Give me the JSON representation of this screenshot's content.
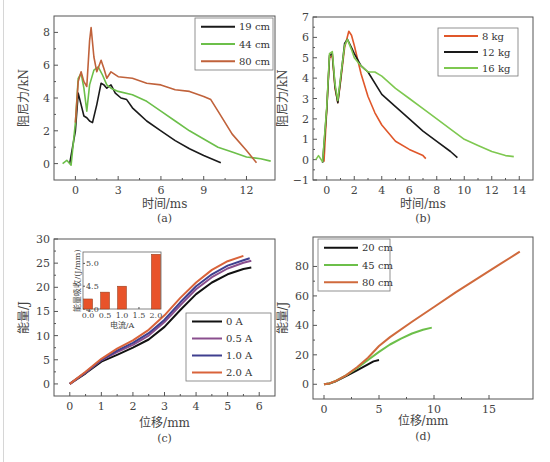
{
  "chart_data": [
    {
      "id": "a",
      "type": "line",
      "caption": "(a)",
      "xlabel": "时间/ms",
      "ylabel": "阻尼力/kN",
      "xlim": [
        -1.5,
        14
      ],
      "ylim": [
        -1,
        9
      ],
      "xticks": [
        0,
        3,
        6,
        9,
        12
      ],
      "yticks": [
        0,
        2,
        4,
        6,
        8
      ],
      "legend_position": "top-right",
      "series": [
        {
          "name": "19 cm",
          "color": "#1a1a1a",
          "x": [
            -0.4,
            0,
            0.2,
            0.4,
            0.6,
            0.8,
            1.0,
            1.2,
            1.5,
            1.8,
            2.0,
            2.2,
            2.5,
            2.8,
            3.2,
            3.6,
            4.0,
            4.5,
            5.0,
            6.0,
            7.0,
            8.0,
            9.0,
            10.2
          ],
          "y": [
            0,
            2.0,
            4.3,
            3.6,
            2.9,
            2.8,
            2.6,
            2.5,
            3.6,
            4.9,
            4.8,
            4.6,
            4.8,
            4.3,
            4.0,
            3.9,
            3.4,
            3.0,
            2.6,
            2.0,
            1.4,
            0.9,
            0.5,
            0.05
          ]
        },
        {
          "name": "44 cm",
          "color": "#6cbf4a",
          "x": [
            -0.9,
            -0.6,
            -0.3,
            0,
            0.2,
            0.4,
            0.6,
            0.8,
            1.0,
            1.3,
            1.6,
            1.9,
            2.2,
            2.5,
            3.0,
            4.0,
            5.0,
            6.0,
            7.0,
            8.0,
            9.0,
            10.0,
            11.0,
            12.0,
            13.0,
            13.7
          ],
          "y": [
            0,
            0.2,
            -0.1,
            2.5,
            5.2,
            5.5,
            4.6,
            3.2,
            4.8,
            5.7,
            5.9,
            5.4,
            4.8,
            4.6,
            4.4,
            4.2,
            3.8,
            3.2,
            2.6,
            2.0,
            1.5,
            1.0,
            0.7,
            0.4,
            0.3,
            0.15
          ]
        },
        {
          "name": "80 cm",
          "color": "#c0623b",
          "x": [
            0,
            0.2,
            0.4,
            0.6,
            0.8,
            1.0,
            1.1,
            1.3,
            1.5,
            1.8,
            2.0,
            2.2,
            2.5,
            3.0,
            4.0,
            5.0,
            6.0,
            7.0,
            8.0,
            9.0,
            9.5,
            10.0,
            11.0,
            12.0,
            12.7
          ],
          "y": [
            2.5,
            5.0,
            5.6,
            5.0,
            4.7,
            7.5,
            8.3,
            6.5,
            5.6,
            6.3,
            5.8,
            5.2,
            5.6,
            5.3,
            5.2,
            4.9,
            4.8,
            4.5,
            4.4,
            4.1,
            3.9,
            3.2,
            1.8,
            0.8,
            0.05
          ]
        }
      ]
    },
    {
      "id": "b",
      "type": "line",
      "caption": "(b)",
      "xlabel": "时间/ms",
      "ylabel": "阻尼力/kN",
      "xlim": [
        -1,
        15
      ],
      "ylim": [
        -1,
        7
      ],
      "xticks": [
        0,
        2,
        4,
        6,
        8,
        10,
        12,
        14
      ],
      "yticks": [
        -1,
        0,
        1,
        2,
        3,
        4,
        5,
        6,
        7
      ],
      "legend_position": "top-right",
      "series": [
        {
          "name": "8 kg",
          "color": "#e0572a",
          "x": [
            -0.2,
            0,
            0.2,
            0.4,
            0.6,
            0.8,
            1.0,
            1.3,
            1.6,
            1.8,
            2.0,
            2.5,
            3.0,
            3.5,
            4.0,
            5.0,
            6.0,
            7.0,
            7.2
          ],
          "y": [
            -0.1,
            2.5,
            5.0,
            5.1,
            3.5,
            2.8,
            3.8,
            5.5,
            6.3,
            6.1,
            5.6,
            4.2,
            3.1,
            2.3,
            1.7,
            0.9,
            0.5,
            0.2,
            0.05
          ]
        },
        {
          "name": "12 kg",
          "color": "#1a1a1a",
          "x": [
            -0.3,
            0,
            0.2,
            0.4,
            0.6,
            0.8,
            1.0,
            1.3,
            1.5,
            1.8,
            2.0,
            2.5,
            3.0,
            4.0,
            5.0,
            6.0,
            7.0,
            8.0,
            9.0,
            9.5
          ],
          "y": [
            -0.15,
            2.5,
            5.1,
            5.2,
            3.6,
            2.8,
            3.9,
            5.7,
            5.9,
            5.5,
            5.2,
            4.6,
            4.3,
            3.2,
            2.6,
            2.0,
            1.4,
            0.9,
            0.4,
            0.1
          ]
        },
        {
          "name": "16 kg",
          "color": "#7ec850",
          "x": [
            -0.8,
            -0.6,
            -0.3,
            0,
            0.2,
            0.4,
            0.6,
            0.8,
            1.0,
            1.3,
            1.5,
            1.8,
            2.0,
            2.5,
            3.0,
            3.5,
            4.0,
            5.0,
            6.0,
            7.0,
            8.0,
            9.0,
            10.0,
            11.0,
            12.0,
            13.0,
            13.6
          ],
          "y": [
            0,
            0.2,
            -0.1,
            2.6,
            5.2,
            5.3,
            3.7,
            2.9,
            4.0,
            5.6,
            5.9,
            5.4,
            5.0,
            4.6,
            4.3,
            4.3,
            4.1,
            3.5,
            3.0,
            2.5,
            2.0,
            1.5,
            1.0,
            0.7,
            0.4,
            0.2,
            0.15
          ]
        }
      ]
    },
    {
      "id": "c",
      "type": "line",
      "caption": "(c)",
      "xlabel": "位移/mm",
      "ylabel": "能量/J",
      "xlim": [
        -0.5,
        6.5
      ],
      "ylim": [
        -2.5,
        30
      ],
      "xticks": [
        0,
        1,
        2,
        3,
        4,
        5,
        6
      ],
      "yticks": [
        0,
        5,
        10,
        15,
        20,
        25,
        30
      ],
      "legend_position": "lower-right",
      "series": [
        {
          "name": "0 A",
          "color": "#111111",
          "x": [
            0,
            0.5,
            1.0,
            1.5,
            2.0,
            2.5,
            3.0,
            3.5,
            4.0,
            4.5,
            5.0,
            5.5,
            5.75
          ],
          "y": [
            0,
            2.2,
            4.6,
            6.0,
            7.5,
            9.2,
            11.8,
            15.3,
            18.6,
            21.0,
            22.7,
            23.8,
            24.1
          ]
        },
        {
          "name": "0.5 A",
          "color": "#8a4f8e",
          "x": [
            0,
            0.5,
            1.0,
            1.5,
            2.0,
            2.5,
            3.0,
            3.5,
            4.0,
            4.5,
            5.0,
            5.5,
            5.75
          ],
          "y": [
            0,
            2.3,
            4.9,
            6.6,
            8.1,
            10.0,
            12.8,
            16.3,
            19.6,
            22.1,
            23.9,
            25.1,
            25.5
          ]
        },
        {
          "name": "1.0 A",
          "color": "#3f3f8f",
          "x": [
            0,
            0.5,
            1.0,
            1.5,
            2.0,
            2.5,
            3.0,
            3.5,
            4.0,
            4.5,
            5.0,
            5.5,
            5.7
          ],
          "y": [
            0,
            2.4,
            5.0,
            6.9,
            8.5,
            10.5,
            13.3,
            16.9,
            20.2,
            22.7,
            24.5,
            25.6,
            26.0
          ]
        },
        {
          "name": "2.0 A",
          "color": "#d9633a",
          "x": [
            0,
            0.5,
            1.0,
            1.5,
            2.0,
            2.5,
            3.0,
            3.5,
            4.0,
            4.5,
            5.0,
            5.5
          ],
          "y": [
            0,
            2.5,
            5.2,
            7.3,
            9.0,
            11.2,
            14.2,
            17.8,
            21.0,
            23.6,
            25.4,
            26.5
          ]
        }
      ],
      "inset": {
        "type": "bar",
        "xlabel": "电流/A",
        "ylabel": "能量吸收/(J/mm)",
        "xticks": [
          "0.0",
          "0.5",
          "1.0",
          "1.5",
          "2.0"
        ],
        "yticks": [
          4.0,
          4.5,
          5.0
        ],
        "ylim": [
          4.0,
          5.25
        ],
        "categories": [
          0.0,
          0.5,
          1.0,
          2.0
        ],
        "values": [
          4.22,
          4.37,
          4.5,
          5.2
        ],
        "color": "#e8532a"
      }
    },
    {
      "id": "d",
      "type": "line",
      "caption": "(d)",
      "xlabel": "位移/mm",
      "ylabel": "能量/J",
      "xlim": [
        -1,
        19
      ],
      "ylim": [
        -10,
        100
      ],
      "xticks": [
        0,
        5,
        10,
        15
      ],
      "yticks": [
        0,
        20,
        40,
        60,
        80
      ],
      "legend_position": "top-left",
      "series": [
        {
          "name": "20 cm",
          "color": "#111111",
          "x": [
            0,
            0.5,
            1,
            2,
            3,
            4,
            4.5,
            5
          ],
          "y": [
            0,
            0.5,
            1.8,
            5.5,
            9.5,
            13.5,
            15.5,
            16.5
          ]
        },
        {
          "name": "45 cm",
          "color": "#6cbf4a",
          "x": [
            0,
            0.5,
            1,
            2,
            3,
            4,
            5,
            6,
            7,
            8,
            9,
            9.8
          ],
          "y": [
            0,
            0.6,
            2.0,
            6.0,
            11.0,
            16.5,
            22.0,
            27.0,
            31.0,
            34.5,
            37.0,
            38.5
          ]
        },
        {
          "name": "80 cm",
          "color": "#d06a3c",
          "x": [
            0,
            0.5,
            1,
            2,
            3,
            4,
            5,
            6,
            8,
            10,
            12,
            14,
            16,
            17.8
          ],
          "y": [
            0,
            0.6,
            2.0,
            6.0,
            11.5,
            18.0,
            26.0,
            32.0,
            42.5,
            52.5,
            62.5,
            72.0,
            81.5,
            90.0
          ]
        }
      ]
    }
  ]
}
